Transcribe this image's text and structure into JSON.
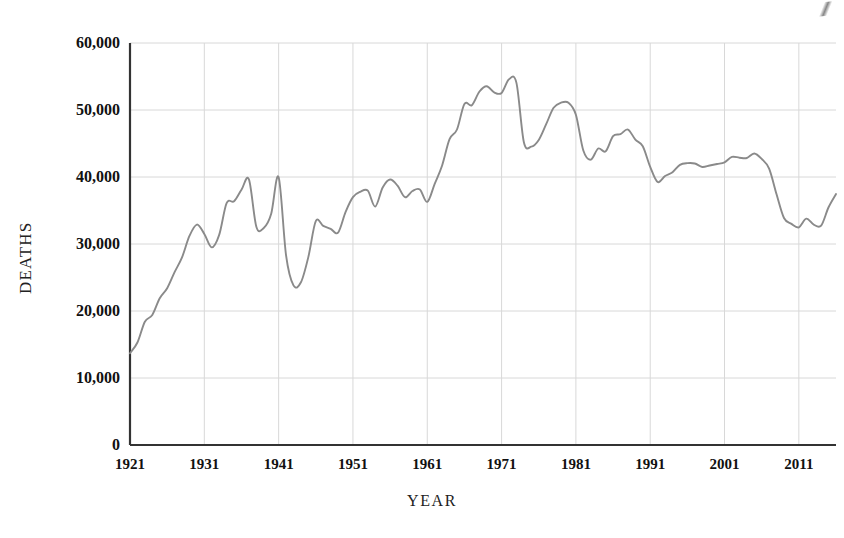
{
  "chart_data": {
    "type": "line",
    "title": "",
    "xlabel": "YEAR",
    "ylabel": "DEATHS",
    "xlim": [
      1921,
      2016
    ],
    "ylim": [
      0,
      60000
    ],
    "grid": true,
    "legend": "none",
    "series_color": "#8a8a8a",
    "axis_color": "#333333",
    "grid_color": "#d8d8d8",
    "y_ticks": [
      "0",
      "10,000",
      "20,000",
      "30,000",
      "40,000",
      "50,000",
      "60,000"
    ],
    "y_tick_values": [
      0,
      10000,
      20000,
      30000,
      40000,
      50000,
      60000
    ],
    "x_ticks": [
      "1921",
      "1931",
      "1941",
      "1951",
      "1961",
      "1971",
      "1981",
      "1991",
      "2001",
      "2011"
    ],
    "x_tick_values": [
      1921,
      1931,
      1941,
      1951,
      1961,
      1971,
      1981,
      1991,
      2001,
      2011
    ],
    "x": [
      1921,
      1922,
      1923,
      1924,
      1925,
      1926,
      1927,
      1928,
      1929,
      1930,
      1931,
      1932,
      1933,
      1934,
      1935,
      1936,
      1937,
      1938,
      1939,
      1940,
      1941,
      1942,
      1943,
      1944,
      1945,
      1946,
      1947,
      1948,
      1949,
      1950,
      1951,
      1952,
      1953,
      1954,
      1955,
      1956,
      1957,
      1958,
      1959,
      1960,
      1961,
      1962,
      1963,
      1964,
      1965,
      1966,
      1967,
      1968,
      1969,
      1970,
      1971,
      1972,
      1973,
      1974,
      1975,
      1976,
      1977,
      1978,
      1979,
      1980,
      1981,
      1982,
      1983,
      1984,
      1985,
      1986,
      1987,
      1988,
      1989,
      1990,
      1991,
      1992,
      1993,
      1994,
      1995,
      1996,
      1997,
      1998,
      1999,
      2000,
      2001,
      2002,
      2003,
      2004,
      2005,
      2006,
      2007,
      2008,
      2009,
      2010,
      2011,
      2012,
      2013,
      2014,
      2015,
      2016
    ],
    "values": [
      13700,
      15300,
      18400,
      19400,
      21900,
      23400,
      25800,
      28000,
      31200,
      32900,
      31500,
      29500,
      31363,
      36101,
      36369,
      38089,
      39643,
      32582,
      32386,
      34501,
      39969,
      28309,
      23823,
      24282,
      28076,
      33411,
      32697,
      32259,
      31701,
      34763,
      36996,
      37794,
      37955,
      35586,
      38426,
      39628,
      38702,
      36981,
      37910,
      38137,
      36285,
      38980,
      41723,
      45645,
      47089,
      50894,
      50724,
      52725,
      53543,
      52627,
      52542,
      54589,
      54052,
      45196,
      44525,
      45523,
      47878,
      50331,
      51093,
      51091,
      49301,
      43945,
      42589,
      44257,
      43825,
      46087,
      46390,
      47087,
      45582,
      44599,
      41508,
      39250,
      40150,
      40716,
      41817,
      42065,
      42013,
      41501,
      41717,
      41945,
      42196,
      43005,
      42884,
      42836,
      43510,
      42708,
      41259,
      37423,
      33883,
      32999,
      32479,
      33782,
      32893,
      32744,
      35485,
      37461
    ]
  }
}
